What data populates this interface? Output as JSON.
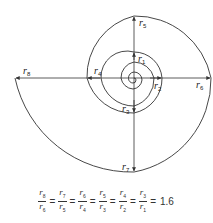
{
  "diagram": {
    "labels": [
      {
        "id": "r1",
        "text": "r",
        "sub": "1"
      },
      {
        "id": "r2",
        "text": "r",
        "sub": "2"
      },
      {
        "id": "r3",
        "text": "r",
        "sub": "3"
      },
      {
        "id": "r4",
        "text": "r",
        "sub": "4"
      },
      {
        "id": "r5",
        "text": "r",
        "sub": "5"
      },
      {
        "id": "r6",
        "text": "r",
        "sub": "6"
      },
      {
        "id": "r7",
        "text": "r",
        "sub": "7"
      },
      {
        "id": "r8",
        "text": "r",
        "sub": "8"
      }
    ],
    "stroke_color": "#333333"
  },
  "formula": {
    "fractions": [
      {
        "num": "8",
        "den": "6"
      },
      {
        "num": "7",
        "den": "5"
      },
      {
        "num": "6",
        "den": "4"
      },
      {
        "num": "5",
        "den": "3"
      },
      {
        "num": "4",
        "den": "2"
      },
      {
        "num": "3",
        "den": "1"
      }
    ],
    "var": "r",
    "equals": "=",
    "result": "1.6"
  }
}
